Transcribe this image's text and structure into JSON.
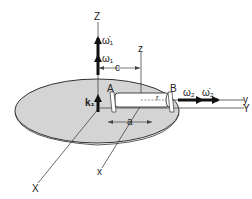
{
  "diagram": {
    "type": "rigid-body kinematics: rotor mounted on rotating disk",
    "colors": {
      "disk_fill": "#d4d4d4",
      "line": "#333333",
      "background": "#ffffff"
    },
    "labels": {
      "Z_axis": "Z",
      "z_axis": "z",
      "y_axis": "y",
      "Y_axis": "Y",
      "X_axis": "X",
      "x_axis": "x",
      "point_A": "A",
      "point_B": "B",
      "omega1_dot": "ω̇₁",
      "omega1": "ω₁",
      "omega2": "ω₂",
      "omega2_dot": "ω̇₂",
      "k1": "k₁",
      "dim_c": "c",
      "dim_a": "a",
      "radius_r": "r"
    }
  }
}
